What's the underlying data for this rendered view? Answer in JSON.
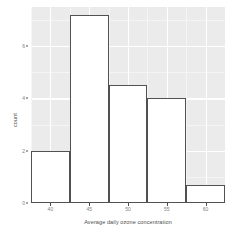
{
  "chart_data": {
    "type": "bar",
    "title": "",
    "subtitle": "",
    "xlabel": "Average daily ozone concentration",
    "ylabel": "count",
    "categories": [
      "37.5-42.5",
      "42.5-47.5",
      "47.5-52.5",
      "52.5-57.5",
      "57.5-62.5"
    ],
    "bin_edges": [
      37.5,
      42.5,
      47.5,
      52.5,
      57.5,
      62.5
    ],
    "bin_width": 5,
    "values": [
      2,
      7.2,
      4.5,
      4,
      0.7
    ],
    "x": [
      40,
      45,
      50,
      55,
      60
    ],
    "xlim": [
      37.5,
      62.5
    ],
    "ylim": [
      0,
      7.5
    ],
    "xticks": [
      40,
      45,
      50,
      55,
      60
    ],
    "xticklabels": [
      "40",
      "45",
      "50",
      "55",
      "60"
    ],
    "yticks": [
      0,
      2,
      4,
      6
    ],
    "yticklabels": [
      "0",
      "2",
      "4",
      "6"
    ],
    "grid": true,
    "grid_color": "#ffffff",
    "panel_background": "#ebebeb",
    "bar_fill": "#ffffff",
    "bar_border": "#515151",
    "legend": null,
    "legend_position": "none",
    "series": [
      {
        "name": "count",
        "values": [
          2,
          7.2,
          4.5,
          4,
          0.7
        ]
      }
    ]
  },
  "axis": {
    "y_title": "count",
    "x_title": "Average daily ozone concentration"
  }
}
